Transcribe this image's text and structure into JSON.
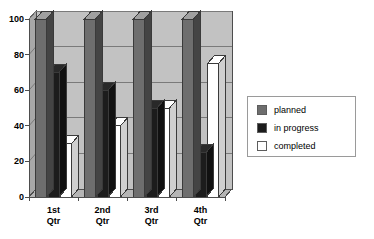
{
  "chart_data": {
    "type": "bar",
    "title": "",
    "xlabel": "",
    "ylabel": "",
    "categories": [
      "1st Qtr",
      "2nd Qtr",
      "3rd Qtr",
      "4th Qtr"
    ],
    "category_lines": [
      [
        "1st",
        "Qtr"
      ],
      [
        "2nd",
        "Qtr"
      ],
      [
        "3rd",
        "Qtr"
      ],
      [
        "4th",
        "Qtr"
      ]
    ],
    "series": [
      {
        "name": "planned",
        "values": [
          100,
          100,
          100,
          100
        ],
        "color": "#6e6e6e"
      },
      {
        "name": "in progress",
        "values": [
          70,
          60,
          50,
          25
        ],
        "color": "#1c1c1c"
      },
      {
        "name": "completed",
        "values": [
          30,
          40,
          50,
          75
        ],
        "color": "#ffffff"
      }
    ],
    "ylim": [
      0,
      100
    ],
    "yticks": [
      0,
      20,
      40,
      60,
      80,
      100
    ],
    "ytick_labels": [
      "0",
      "20",
      "40",
      "60",
      "80",
      "100"
    ],
    "grid": true,
    "grid_axis": "y",
    "legend_position": "right",
    "render_style": "3d-clustered-column",
    "plot_background": "#c2c2c2"
  },
  "legend": {
    "entries": [
      {
        "label": "planned",
        "swatch": "#6e6e6e"
      },
      {
        "label": "in progress",
        "swatch": "#1c1c1c"
      },
      {
        "label": "completed",
        "swatch": "#ffffff"
      }
    ]
  },
  "colors": {
    "plot_floor": "#c2c2c2",
    "back_wall": "#c2c2c2",
    "side_wall": "#a8a8a8",
    "gridline": "#7a7a7a",
    "axis": "#4d4d4d",
    "text": "#000000",
    "legend_border": "#9a9a9a"
  }
}
